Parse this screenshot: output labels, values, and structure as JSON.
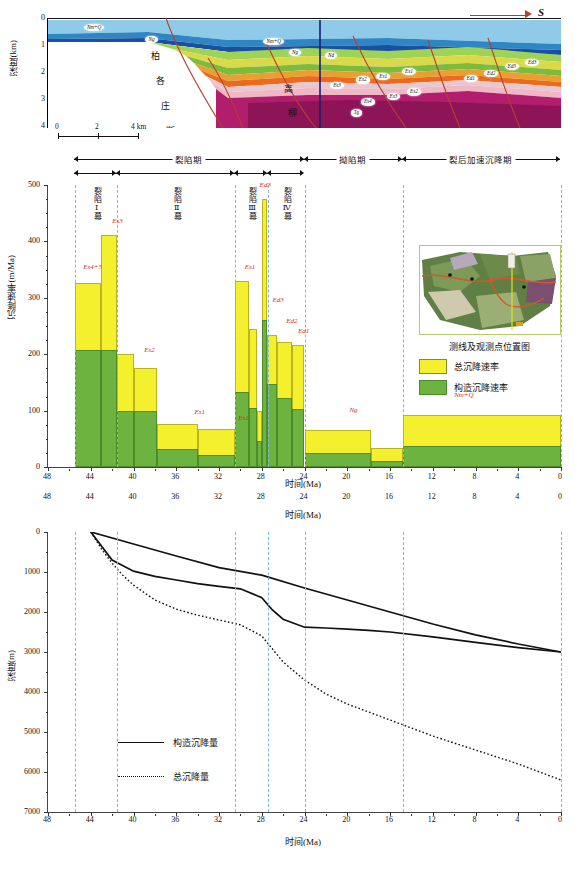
{
  "figure": {
    "panelA": {
      "name": "geologic-cross-section",
      "ylabel": "深度(km)",
      "yticks": [
        "0",
        "1",
        "2",
        "3",
        "4"
      ],
      "direction_label": "S",
      "scalebar": {
        "ticks": [
          "0",
          "2",
          "4 km"
        ]
      },
      "fault_names": [
        "柏各庄断层",
        "高柳断层"
      ],
      "fault1_chars": [
        "柏",
        "各",
        "庄",
        "断",
        "层"
      ],
      "fault2_chars": [
        "高",
        "柳",
        "断",
        "层"
      ],
      "unit_bubbles": [
        {
          "label": "Nm+Q",
          "x": 9,
          "y": 8
        },
        {
          "label": "Ng",
          "x": 22,
          "y": 19
        },
        {
          "label": "Nm+Q",
          "x": 45,
          "y": 20
        },
        {
          "label": "Ng",
          "x": 50,
          "y": 28
        },
        {
          "label": "Nd",
          "x": 57,
          "y": 31
        },
        {
          "label": "Es3",
          "x": 57,
          "y": 58
        },
        {
          "label": "Es2",
          "x": 61,
          "y": 53
        },
        {
          "label": "Es1",
          "x": 65,
          "y": 50
        },
        {
          "label": "Es1",
          "x": 69,
          "y": 46
        },
        {
          "label": "Es4",
          "x": 63,
          "y": 72
        },
        {
          "label": "Es3",
          "x": 67,
          "y": 67
        },
        {
          "label": "Es2",
          "x": 71,
          "y": 63
        },
        {
          "label": "Tg",
          "x": 61,
          "y": 82
        },
        {
          "label": "Ed1",
          "x": 82,
          "y": 51
        },
        {
          "label": "Ed2",
          "x": 86,
          "y": 46
        },
        {
          "label": "Ed3",
          "x": 90,
          "y": 41
        },
        {
          "label": "Ed3",
          "x": 94,
          "y": 38
        }
      ]
    },
    "panelB": {
      "name": "subsidence-rate-bar-chart",
      "ylabel": "沉降速率(m/Ma)",
      "xlabel": "时间(Ma)",
      "phases": [
        {
          "label": "裂陷期",
          "start": 45.5,
          "end": 24.0
        },
        {
          "label": "拗陷期",
          "start": 24.0,
          "end": 14.8
        },
        {
          "label": "裂后加速沉降期",
          "start": 14.8,
          "end": 0.0
        }
      ],
      "subphases": [
        {
          "label": "裂陷Ⅰ幕",
          "start": 45.5,
          "end": 41.5
        },
        {
          "label": "裂陷Ⅱ幕",
          "start": 41.5,
          "end": 30.5
        },
        {
          "label": "裂陷Ⅲ幕",
          "start": 30.5,
          "end": 27.4
        },
        {
          "label": "裂陷Ⅳ幕",
          "start": 27.4,
          "end": 24.0
        }
      ],
      "legend": {
        "caption": "测线及观测点位置图",
        "items": [
          {
            "label": "总沉降速率",
            "color": "#f5f02e"
          },
          {
            "label": "构造沉降速率",
            "color": "#6cb33f"
          }
        ]
      },
      "bar_labels": [
        {
          "text": "Es4+5",
          "x": 44.7,
          "y": 345
        },
        {
          "text": "Es3",
          "x": 42.0,
          "y": 428
        },
        {
          "text": "Es2",
          "x": 39.0,
          "y": 198
        },
        {
          "text": "Es1",
          "x": 34.3,
          "y": 88
        },
        {
          "text": "Es1",
          "x": 30.2,
          "y": 78
        },
        {
          "text": "Es1",
          "x": 29.6,
          "y": 345
        },
        {
          "text": "Ed3",
          "x": 28.2,
          "y": 492
        },
        {
          "text": "Ed3",
          "x": 27.0,
          "y": 288
        },
        {
          "text": "Ed2",
          "x": 25.7,
          "y": 250
        },
        {
          "text": "Ed1",
          "x": 24.6,
          "y": 232
        },
        {
          "text": "Ng",
          "x": 19.8,
          "y": 93
        },
        {
          "text": "Nm+Q",
          "x": 10.0,
          "y": 118
        }
      ]
    },
    "panelC": {
      "name": "subsidence-depth-curves",
      "ylabel": "深度(m)",
      "xlabel": "时间(Ma)",
      "legend": [
        {
          "label": "构造沉降量",
          "style": "solid"
        },
        {
          "label": "总沉降量",
          "style": "dotted"
        }
      ]
    }
  },
  "chart_data": [
    {
      "type": "bar",
      "id": "subsidence-rate",
      "title": "",
      "xlabel": "时间(Ma)",
      "ylabel": "沉降速率(m/Ma)",
      "xlim": [
        48,
        0
      ],
      "ylim": [
        0,
        500
      ],
      "xticks": [
        48,
        44,
        40,
        36,
        32,
        28,
        24,
        20,
        16,
        12,
        8,
        4,
        0
      ],
      "yticks": [
        0,
        100,
        200,
        300,
        400,
        500
      ],
      "grid": false,
      "legend_position": "right",
      "series": [
        {
          "name": "总沉降速率",
          "color": "#f5f02e"
        },
        {
          "name": "构造沉降速率",
          "color": "#6cb33f"
        }
      ],
      "bars": [
        {
          "unit": "Es4+5",
          "x_start": 45.5,
          "x_end": 43.0,
          "total": 327,
          "tectonic": 207
        },
        {
          "unit": "Es3",
          "x_start": 43.0,
          "x_end": 41.5,
          "total": 411,
          "tectonic": 207
        },
        {
          "unit": "Es3b",
          "x_start": 41.5,
          "x_end": 40.0,
          "total": 201,
          "tectonic": 99
        },
        {
          "unit": "Es2",
          "x_start": 40.0,
          "x_end": 37.8,
          "total": 175,
          "tectonic": 99
        },
        {
          "unit": "Es2b",
          "x_start": 37.8,
          "x_end": 34.0,
          "total": 77,
          "tectonic": 32
        },
        {
          "unit": "Es1",
          "x_start": 34.0,
          "x_end": 30.5,
          "total": 68,
          "tectonic": 21
        },
        {
          "unit": "Es1u",
          "x_start": 30.5,
          "x_end": 29.2,
          "total": 329,
          "tectonic": 133
        },
        {
          "unit": "Es1t",
          "x_start": 29.2,
          "x_end": 28.4,
          "total": 245,
          "tectonic": 105
        },
        {
          "unit": "Ed3a",
          "x_start": 28.4,
          "x_end": 28.0,
          "total": 100,
          "tectonic": 47
        },
        {
          "unit": "Ed3",
          "x_start": 28.0,
          "x_end": 27.5,
          "total": 476,
          "tectonic": 261
        },
        {
          "unit": "Ed3p",
          "x_start": 27.5,
          "x_end": 26.6,
          "total": 234,
          "tectonic": 148
        },
        {
          "unit": "Ed2",
          "x_start": 26.6,
          "x_end": 25.2,
          "total": 222,
          "tectonic": 122
        },
        {
          "unit": "Ed1",
          "x_start": 25.2,
          "x_end": 24.0,
          "total": 217,
          "tectonic": 102
        },
        {
          "unit": "Ng",
          "x_start": 24.0,
          "x_end": 17.8,
          "total": 66,
          "tectonic": 24
        },
        {
          "unit": "Ng2",
          "x_start": 17.8,
          "x_end": 14.8,
          "total": 34,
          "tectonic": 11
        },
        {
          "unit": "Nm+Q",
          "x_start": 14.8,
          "x_end": 0.0,
          "total": 93,
          "tectonic": 38
        }
      ]
    },
    {
      "type": "line",
      "id": "subsidence-depth",
      "title": "",
      "xlabel": "时间(Ma)",
      "ylabel": "深度(m)",
      "xlim": [
        48,
        0
      ],
      "ylim": [
        7000,
        0
      ],
      "xticks": [
        48,
        44,
        40,
        36,
        32,
        28,
        24,
        20,
        16,
        12,
        8,
        4,
        0
      ],
      "yticks": [
        0,
        1000,
        2000,
        3000,
        4000,
        5000,
        6000,
        7000
      ],
      "grid": false,
      "legend_position": "inside-left",
      "series": [
        {
          "name": "构造沉降量-上",
          "style": "solid",
          "x": [
            44,
            40,
            36,
            32,
            28,
            24,
            20,
            16,
            12,
            8,
            4,
            0
          ],
          "y": [
            0,
            300,
            600,
            890,
            1080,
            1400,
            1700,
            2000,
            2300,
            2570,
            2800,
            3000
          ]
        },
        {
          "name": "构造沉降量-下",
          "style": "solid",
          "x": [
            44,
            42,
            40,
            38,
            36,
            34,
            32,
            30,
            28,
            27,
            26,
            24,
            22,
            20,
            18,
            16,
            12,
            8,
            4,
            0
          ],
          "y": [
            0,
            700,
            980,
            1110,
            1200,
            1290,
            1360,
            1420,
            1640,
            1950,
            2180,
            2380,
            2400,
            2430,
            2460,
            2500,
            2620,
            2760,
            2890,
            3000
          ]
        },
        {
          "name": "总沉降量",
          "style": "dotted",
          "x": [
            44,
            43,
            42,
            41,
            40,
            38,
            36,
            34,
            32,
            30,
            28,
            26,
            24,
            22,
            20,
            16,
            12,
            8,
            4,
            0
          ],
          "y": [
            0,
            420,
            780,
            1080,
            1330,
            1700,
            1930,
            2080,
            2200,
            2320,
            2600,
            3250,
            3700,
            4050,
            4300,
            4700,
            5100,
            5450,
            5800,
            6200
          ]
        }
      ]
    }
  ]
}
